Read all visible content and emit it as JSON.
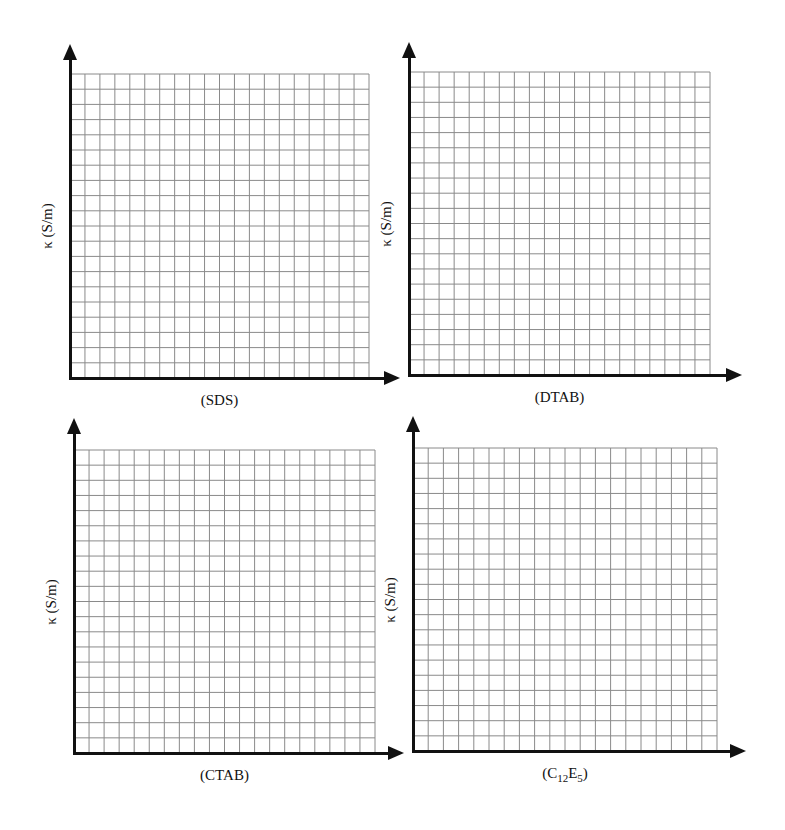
{
  "colors": {
    "axis": "#111111",
    "grid": "#8a8a8a",
    "background": "#ffffff"
  },
  "chart_data": [
    {
      "type": "line",
      "panel": "top-left",
      "title": "",
      "xlabel": "(SDS)",
      "ylabel": "κ (S/m)",
      "series": [],
      "grid": {
        "on": true,
        "columns": 20,
        "rows": 20
      },
      "axis_box": {
        "axis_x": 70,
        "axis_y": 378,
        "grid_left": 70,
        "grid_top": 74,
        "grid_right": 369,
        "arrow_x_tip": 400,
        "arrow_y_tip": 44
      }
    },
    {
      "type": "line",
      "panel": "top-right",
      "title": "",
      "xlabel": "(DTAB)",
      "ylabel": "κ (S/m)",
      "series": [],
      "grid": {
        "on": true,
        "columns": 20,
        "rows": 20
      },
      "axis_box": {
        "axis_x": 409,
        "axis_y": 375,
        "grid_left": 409,
        "grid_top": 72,
        "grid_right": 710,
        "arrow_x_tip": 742,
        "arrow_y_tip": 42
      }
    },
    {
      "type": "line",
      "panel": "bottom-left",
      "title": "",
      "xlabel": "(CTAB)",
      "ylabel": "κ (S/m)",
      "series": [],
      "grid": {
        "on": true,
        "columns": 20,
        "rows": 20
      },
      "axis_box": {
        "axis_x": 74,
        "axis_y": 753,
        "grid_left": 74,
        "grid_top": 450,
        "grid_right": 375,
        "arrow_x_tip": 404,
        "arrow_y_tip": 418
      }
    },
    {
      "type": "line",
      "panel": "bottom-right",
      "title": "",
      "xlabel": "(C12E5)",
      "xlabel_parts": {
        "pre": "(C",
        "sub1": "12",
        "mid": "E",
        "sub2": "5",
        "post": ")"
      },
      "ylabel": "κ (S/m)",
      "series": [],
      "grid": {
        "on": true,
        "columns": 20,
        "rows": 20
      },
      "axis_box": {
        "axis_x": 413,
        "axis_y": 751,
        "grid_left": 413,
        "grid_top": 448,
        "grid_right": 717,
        "arrow_x_tip": 746,
        "arrow_y_tip": 416
      }
    }
  ]
}
